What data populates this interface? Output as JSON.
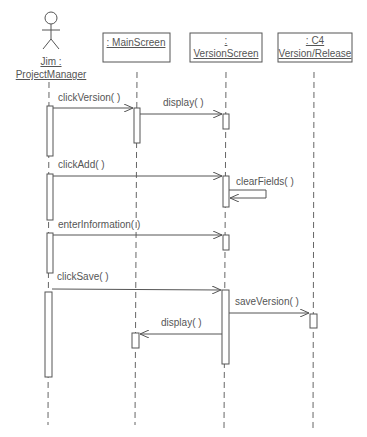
{
  "diagram": {
    "type": "uml-sequence",
    "actor": {
      "line1": "Jim :",
      "line2": "ProjectManager"
    },
    "objects": [
      {
        "id": "main",
        "line1": ": MainScreen",
        "line2": ""
      },
      {
        "id": "version",
        "line1": ":",
        "line2": "VersionScreen"
      },
      {
        "id": "c4",
        "line1": ": C4",
        "line2": "Version/Release"
      }
    ],
    "messages": [
      {
        "from": "actor",
        "to": "main",
        "label": "clickVersion( )"
      },
      {
        "from": "main",
        "to": "version",
        "label": "display( )"
      },
      {
        "from": "actor",
        "to": "version",
        "label": "clickAdd( )"
      },
      {
        "from": "version",
        "to": "version",
        "label": "clearFields( )"
      },
      {
        "from": "actor",
        "to": "version",
        "label": "enterInformation( )"
      },
      {
        "from": "actor",
        "to": "version",
        "label": "clickSave( )"
      },
      {
        "from": "version",
        "to": "c4",
        "label": "saveVersion( )"
      },
      {
        "from": "version",
        "to": "main",
        "label": "display( )"
      }
    ],
    "colors": {
      "line": "#555555",
      "text": "#555555",
      "background": "#ffffff"
    }
  }
}
